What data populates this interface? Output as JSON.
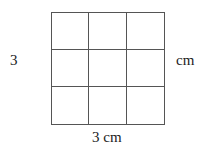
{
  "diagram": {
    "type": "square-grid",
    "rows": 3,
    "cols": 3,
    "side_label_left": "3",
    "side_label_right": "cm",
    "bottom_label": "3 cm",
    "line_color": "#555555"
  }
}
